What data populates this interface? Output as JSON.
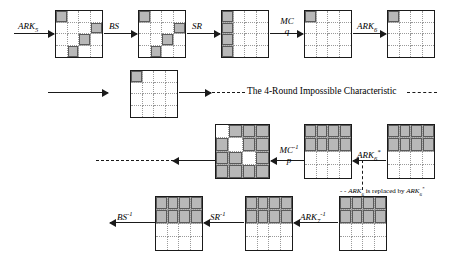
{
  "diagram": {
    "title_note": "The 4-Round Impossible Characteristic",
    "footnote_prefix": "ARK",
    "footnote_sub1": "6",
    "footnote_mid": " is replaced by ",
    "footnote_prefix2": "ARK",
    "footnote_sub2": "6",
    "footnote_sup2": "*",
    "footnote_full": "ARK6 is replaced by ARK6*"
  },
  "labels": {
    "ark5": {
      "base": "ARK",
      "sub": "5",
      "sup": ""
    },
    "bs": {
      "base": "BS",
      "sub": "",
      "sup": ""
    },
    "sr": {
      "base": "SR",
      "sub": "",
      "sup": ""
    },
    "mc": {
      "base": "MC",
      "sub": "",
      "sup": ""
    },
    "mc_den": "q",
    "ark6": {
      "base": "ARK",
      "sub": "6",
      "sup": ""
    },
    "mc_inv": {
      "base": "MC",
      "sub": "",
      "sup": "-1"
    },
    "mc_inv_den": "p",
    "ark6_star": {
      "base": "ARK",
      "sub": "6",
      "sup": "*"
    },
    "ark7_inv": {
      "base": "ARK",
      "sub": "7",
      "sup": "-1"
    },
    "sr_inv": {
      "base": "SR",
      "sub": "",
      "sup": "-1"
    },
    "bs_inv": {
      "base": "BS",
      "sub": "",
      "sup": "-1"
    }
  },
  "states": {
    "r1g1": {
      "name": "state-ark5-output",
      "cells": [
        1,
        0,
        0,
        0,
        0,
        0,
        0,
        1,
        0,
        0,
        1,
        0,
        0,
        1,
        0,
        0
      ]
    },
    "r1g2": {
      "name": "state-after-bs",
      "cells": [
        1,
        0,
        0,
        0,
        0,
        0,
        0,
        1,
        0,
        0,
        1,
        0,
        0,
        1,
        0,
        0
      ]
    },
    "r1g3": {
      "name": "state-after-sr",
      "cells": [
        1,
        0,
        0,
        0,
        1,
        0,
        0,
        0,
        1,
        0,
        0,
        0,
        1,
        0,
        0,
        0
      ]
    },
    "r1g4": {
      "name": "state-after-mc",
      "cells": [
        1,
        0,
        0,
        0,
        0,
        0,
        0,
        0,
        0,
        0,
        0,
        0,
        0,
        0,
        0,
        0
      ]
    },
    "r1g5": {
      "name": "state-after-ark6",
      "cells": [
        1,
        0,
        0,
        0,
        0,
        0,
        0,
        0,
        0,
        0,
        0,
        0,
        0,
        0,
        0,
        0
      ]
    },
    "r2g1": {
      "name": "state-characteristic-input",
      "cells": [
        1,
        0,
        0,
        0,
        0,
        0,
        0,
        0,
        0,
        0,
        0,
        0,
        0,
        0,
        0,
        0
      ]
    },
    "r3g1": {
      "name": "state-before-mc-inverse",
      "cells": [
        0,
        1,
        1,
        1,
        1,
        0,
        1,
        1,
        1,
        1,
        0,
        1,
        1,
        1,
        1,
        1
      ]
    },
    "r3g2": {
      "name": "state-after-mc-inverse",
      "cells": [
        1,
        1,
        1,
        1,
        1,
        1,
        1,
        1,
        0,
        0,
        0,
        0,
        0,
        0,
        0,
        0
      ]
    },
    "r3g3": {
      "name": "state-after-ark6-star",
      "cells": [
        1,
        1,
        1,
        1,
        1,
        1,
        1,
        1,
        0,
        0,
        0,
        0,
        0,
        0,
        0,
        0
      ]
    },
    "r4g1": {
      "name": "state-after-bs-inverse",
      "cells": [
        1,
        1,
        1,
        1,
        1,
        1,
        1,
        1,
        0,
        0,
        0,
        0,
        0,
        0,
        0,
        0
      ]
    },
    "r4g2": {
      "name": "state-after-sr-inverse",
      "cells": [
        1,
        1,
        1,
        1,
        1,
        1,
        1,
        1,
        0,
        0,
        0,
        0,
        0,
        0,
        0,
        0
      ]
    },
    "r4g3": {
      "name": "state-ciphertext",
      "cells": [
        1,
        1,
        1,
        1,
        1,
        1,
        1,
        1,
        0,
        0,
        0,
        0,
        0,
        0,
        0,
        0
      ]
    }
  },
  "colors": {
    "shaded": "#b8b8b8",
    "stroke": "#1a1a1a",
    "dotted": "#9a9a9a",
    "background": "#ffffff"
  }
}
